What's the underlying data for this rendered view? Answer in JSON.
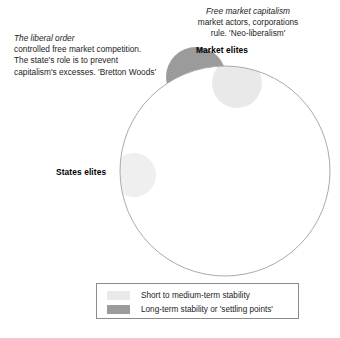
{
  "diagram": {
    "title_hidden": "",
    "main_circle": {
      "name": "system-boundary-circle",
      "cx": 225,
      "cy": 171,
      "r": 105,
      "stroke": "#aaaaaa",
      "fill": "#ffffff"
    },
    "annotations": [
      {
        "id": "liberal-order",
        "lead": "The liberal order",
        "lines": [
          "controlled free market competition.",
          "The state's role is to prevent",
          "capitalism's excesses. 'Bretton Woods'"
        ]
      },
      {
        "id": "free-market-capitalism",
        "lead": "Free market capitalism",
        "lines": [
          "market actors, corporations",
          "rule. 'Neo-liberalism'"
        ]
      }
    ],
    "nodes": [
      {
        "id": "market-elites",
        "label": "Market elites",
        "blob_fill": "#e9e9e9",
        "cx": 237,
        "cy": 82,
        "r": 24,
        "clip": "inside"
      },
      {
        "id": "states-elites",
        "label": "States elites",
        "blob_fill": "#eeeeee",
        "cx": 135,
        "cy": 175,
        "r": 22,
        "clip": "inside"
      },
      {
        "id": "settling-point-blob",
        "label": "",
        "blob_fill": "#9b9b9b",
        "cx": 196,
        "cy": 77,
        "r": 28,
        "clip": "outside-below"
      }
    ],
    "legend": {
      "title": "",
      "items": [
        {
          "swatch_color": "#e9e9e9",
          "label": "Short to medium-term stability"
        },
        {
          "swatch_color": "#9b9b9b",
          "label": "Long-term stability or 'settling points'"
        }
      ]
    }
  }
}
